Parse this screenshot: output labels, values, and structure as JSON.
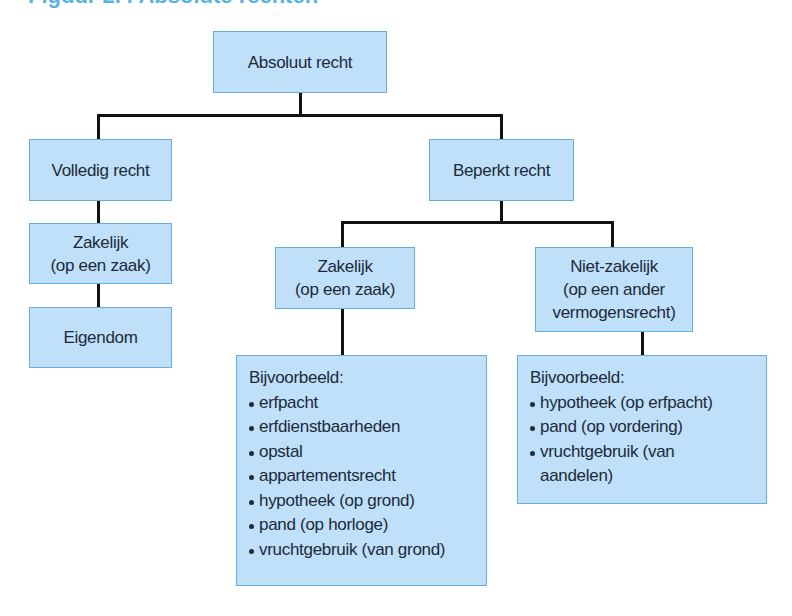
{
  "title": "Figuur 2.4 Absolute rechten",
  "diagram": {
    "root": {
      "label": "Absoluut recht"
    },
    "volledig": {
      "label": "Volledig recht",
      "zakelijk": {
        "line1": "Zakelijk",
        "line2": "(op een zaak)"
      },
      "eigendom": {
        "label": "Eigendom"
      }
    },
    "beperkt": {
      "label": "Beperkt recht",
      "zakelijk": {
        "line1": "Zakelijk",
        "line2": "(op een zaak)"
      },
      "niet_zakelijk": {
        "line1": "Niet-zakelijk",
        "line2": "(op een ander",
        "line3": "vermogensrecht)"
      },
      "zakelijk_examples": {
        "heading": "Bijvoorbeeld:",
        "items": [
          "erfpacht",
          "erfdienstbaarheden",
          "opstal",
          "appartementsrecht",
          "hypotheek (op grond)",
          "pand (op horloge)",
          "vruchtgebruik (van grond)"
        ]
      },
      "niet_zakelijk_examples": {
        "heading": "Bijvoorbeeld:",
        "items": [
          "hypotheek (op erfpacht)",
          "pand (op vordering)",
          "vruchtgebruik (van",
          "aandelen)"
        ]
      }
    }
  },
  "colors": {
    "box_fill": "#bfe0f8",
    "box_border": "#64aee3",
    "connector": "#111111",
    "title": "#58b3df"
  }
}
